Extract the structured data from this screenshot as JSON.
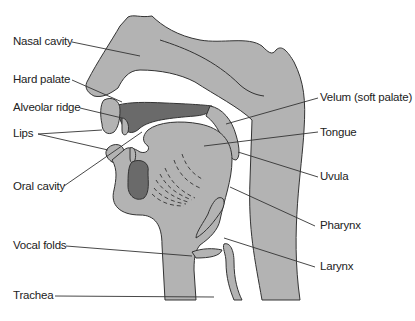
{
  "diagram": {
    "colors": {
      "tissue": "#b3b3b3",
      "dark_tissue": "#6a6a6a",
      "outline": "#333333",
      "leader": "#333333",
      "background": "#ffffff"
    },
    "labels_left": [
      {
        "id": "nasal-cavity",
        "text": "Nasal cavity"
      },
      {
        "id": "hard-palate",
        "text": "Hard palate"
      },
      {
        "id": "alveolar-ridge",
        "text": "Alveolar ridge"
      },
      {
        "id": "lips",
        "text": "Lips"
      },
      {
        "id": "oral-cavity",
        "text": "Oral cavity"
      },
      {
        "id": "vocal-folds",
        "text": "Vocal folds"
      },
      {
        "id": "trachea",
        "text": "Trachea"
      }
    ],
    "labels_right": [
      {
        "id": "velum",
        "text": "Velum (soft palate)"
      },
      {
        "id": "tongue",
        "text": "Tongue"
      },
      {
        "id": "uvula",
        "text": "Uvula"
      },
      {
        "id": "pharynx",
        "text": "Pharynx"
      },
      {
        "id": "larynx",
        "text": "Larynx"
      }
    ]
  }
}
